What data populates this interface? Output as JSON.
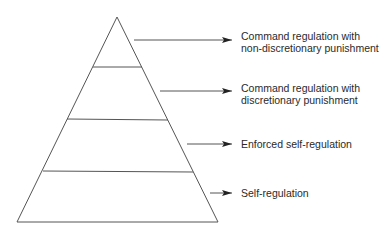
{
  "diagram": {
    "type": "pyramid",
    "colors": {
      "line": "#555555",
      "arrow": "#222222",
      "text": "#2a2a2a",
      "background": "#ffffff"
    },
    "levels": [
      {
        "position": "top",
        "label_lines": [
          "Command regulation with",
          "non-discretionary punishment"
        ]
      },
      {
        "position": "second",
        "label_lines": [
          "Command regulation with",
          "discretionary punishment"
        ]
      },
      {
        "position": "third",
        "label_lines": [
          "Enforced self-regulation"
        ]
      },
      {
        "position": "bottom",
        "label_lines": [
          "Self-regulation"
        ]
      }
    ]
  }
}
